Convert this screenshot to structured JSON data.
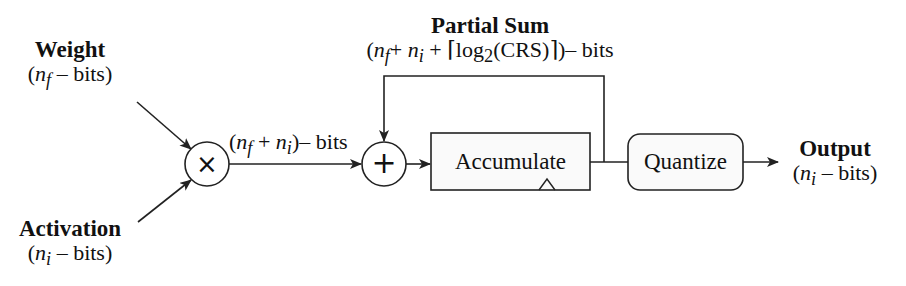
{
  "inputs": {
    "weight": {
      "title": "Weight",
      "bits_var": "n",
      "bits_sub": "f",
      "bits_suffix": " – bits)"
    },
    "activation": {
      "title": "Activation",
      "bits_var": "n",
      "bits_sub": "i",
      "bits_suffix": " – bits)"
    }
  },
  "operators": {
    "multiply": {
      "symbol": "×"
    },
    "add": {
      "symbol": "+"
    }
  },
  "product_label": {
    "open": "(",
    "var1": "n",
    "sub1": "f",
    "plus": " + ",
    "var2": "n",
    "sub2": "i",
    "suffix": ")– bits"
  },
  "partial_sum": {
    "title": "Partial Sum",
    "open": "(",
    "var1": "n",
    "sub1": "f",
    "plus1": "+ ",
    "var2": "n",
    "sub2": "i",
    "plus2": " + ⌈log",
    "log_base": "2",
    "arg": "(CRS)⌉)– bits"
  },
  "blocks": {
    "accumulate": {
      "label": "Accumulate"
    },
    "quantize": {
      "label": "Quantize"
    }
  },
  "output": {
    "title": "Output",
    "bits_var": "n",
    "bits_sub": "i",
    "bits_suffix": " – bits)"
  },
  "colors": {
    "stroke": "#222222",
    "box_fill": "#fafafa",
    "background": "#ffffff"
  }
}
